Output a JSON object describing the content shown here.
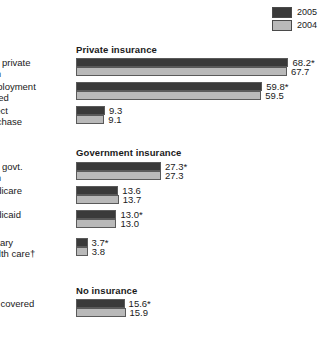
{
  "legend": {
    "items": [
      {
        "label": "2005",
        "color": "#3a3a3a",
        "key": "y2005"
      },
      {
        "label": "2004",
        "color": "#b9b9b9",
        "key": "y2004"
      }
    ]
  },
  "chart_data": {
    "type": "bar",
    "orientation": "horizontal",
    "title": "",
    "xlabel": "",
    "ylabel": "",
    "xlim": [
      0,
      70
    ],
    "grid": false,
    "legend_position": "top-right",
    "series": [
      {
        "name": "2005",
        "color": "#3a3a3a"
      },
      {
        "name": "2004",
        "color": "#b9b9b9"
      }
    ],
    "sections": [
      {
        "title": "Private insurance",
        "categories": [
          {
            "label_line1": "Any private",
            "label_line2": "plan",
            "values": [
              68.2,
              67.7
            ],
            "value_labels": [
              "68.2*",
              "67.7"
            ]
          },
          {
            "label_line1": "Employment",
            "label_line2": "based",
            "values": [
              59.8,
              59.5
            ],
            "value_labels": [
              "59.8*",
              "59.5"
            ]
          },
          {
            "label_line1": "Direct",
            "label_line2": "purchase",
            "values": [
              9.3,
              9.1
            ],
            "value_labels": [
              "9.3",
              "9.1"
            ]
          }
        ]
      },
      {
        "title": "Government insurance",
        "categories": [
          {
            "label_line1": "Any govt.",
            "label_line2": "plan",
            "values": [
              27.3,
              27.3
            ],
            "value_labels": [
              "27.3*",
              "27.3"
            ]
          },
          {
            "label_line1": "Medicare",
            "label_line2": "",
            "values": [
              13.6,
              13.7
            ],
            "value_labels": [
              "13.6",
              "13.7"
            ]
          },
          {
            "label_line1": "Medicaid",
            "label_line2": "",
            "values": [
              13.0,
              13.0
            ],
            "value_labels": [
              "13.0*",
              "13.0"
            ]
          },
          {
            "label_line1": "Military",
            "label_line2": "health care†",
            "values": [
              3.7,
              3.8
            ],
            "value_labels": [
              "3.7*",
              "3.8"
            ]
          }
        ]
      },
      {
        "title": "No insurance",
        "categories": [
          {
            "label_line1": "Not covered",
            "label_line2": "",
            "values": [
              15.6,
              15.9
            ],
            "value_labels": [
              "15.6*",
              "15.9"
            ]
          }
        ]
      }
    ]
  }
}
